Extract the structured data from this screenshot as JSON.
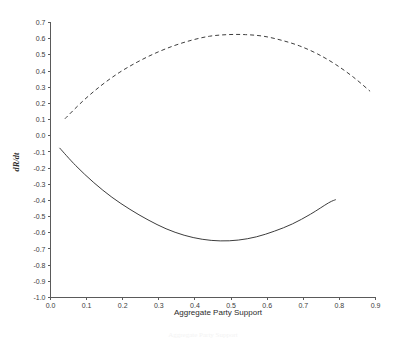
{
  "chart_data": {
    "type": "line",
    "title": "",
    "xlabel": "Aggregate Party Support",
    "ylabel": "dR/dt",
    "xlim": [
      0.0,
      0.9
    ],
    "ylim": [
      -1.0,
      0.7
    ],
    "grid": false,
    "legend": "none",
    "xticks": [
      "0.0",
      "0.1",
      "0.2",
      "0.3",
      "0.4",
      "0.5",
      "0.6",
      "0.7",
      "0.8",
      "0.9"
    ],
    "xtick_values": [
      0.0,
      0.1,
      0.2,
      0.3,
      0.4,
      0.5,
      0.6,
      0.7,
      0.8,
      0.9
    ],
    "yticks": [
      "0.7",
      "0.6",
      "0.5",
      "0.4",
      "0.3",
      "0.2",
      "0.1",
      "0.0",
      "-0.1",
      "-0.2",
      "-0.3",
      "-0.4",
      "-0.5",
      "-0.6",
      "-0.7",
      "-0.8",
      "-0.9",
      "-1.0"
    ],
    "ytick_values": [
      0.7,
      0.6,
      0.5,
      0.4,
      0.3,
      0.2,
      0.1,
      0.0,
      -0.1,
      -0.2,
      -0.3,
      -0.4,
      -0.5,
      -0.6,
      -0.7,
      -0.8,
      -0.9,
      -1.0
    ],
    "series": [
      {
        "name": "dR/dt upper",
        "style": "dashed",
        "color": "#3d3d3d",
        "x": [
          0.04,
          0.09,
          0.14,
          0.19,
          0.24,
          0.29,
          0.34,
          0.39,
          0.44,
          0.49,
          0.54,
          0.59,
          0.64,
          0.69,
          0.74,
          0.79,
          0.84,
          0.885
        ],
        "y": [
          0.105,
          0.215,
          0.31,
          0.39,
          0.455,
          0.51,
          0.555,
          0.59,
          0.615,
          0.625,
          0.625,
          0.615,
          0.59,
          0.555,
          0.505,
          0.44,
          0.36,
          0.275
        ]
      },
      {
        "name": "dR/dt lower",
        "style": "solid",
        "color": "#3d3d3d",
        "x": [
          0.025,
          0.07,
          0.12,
          0.17,
          0.22,
          0.27,
          0.32,
          0.37,
          0.42,
          0.47,
          0.52,
          0.57,
          0.62,
          0.67,
          0.72,
          0.77,
          0.79
        ],
        "y": [
          -0.075,
          -0.185,
          -0.29,
          -0.38,
          -0.455,
          -0.52,
          -0.575,
          -0.615,
          -0.64,
          -0.65,
          -0.645,
          -0.625,
          -0.59,
          -0.545,
          -0.485,
          -0.415,
          -0.395
        ]
      }
    ]
  },
  "caption": {
    "text": "Aggregate Party Support"
  }
}
